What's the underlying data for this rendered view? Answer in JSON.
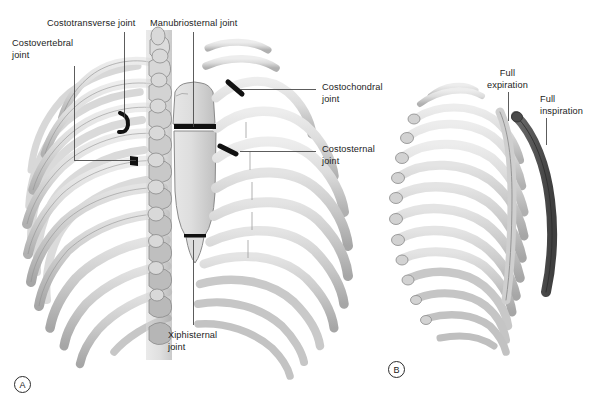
{
  "figure": {
    "background": "#ffffff",
    "type": "anatomical-illustration"
  },
  "palette": {
    "bone_light": "#e9e9e9",
    "bone_mid": "#d2d2d2",
    "bone_shade": "#b4b4b4",
    "bone_dark": "#9a9a9a",
    "outline": "#6e6e6e",
    "joint_marker": "#111111",
    "inspiration_rib": "#595959",
    "leader_line": "#4a4a4a",
    "text": "#1c1c1c"
  },
  "panels": [
    {
      "id": "A",
      "label": "A",
      "x": 14,
      "y": 376,
      "caption": "anterior view of thoracic cage with sternum and costal joints"
    },
    {
      "id": "B",
      "label": "B",
      "x": 388,
      "y": 361,
      "caption": "lateral view showing rib position in full expiration and full inspiration"
    }
  ],
  "annotations": [
    {
      "key": "costotransverse",
      "text": "Costotransverse joint",
      "lines": [
        "Costotransverse joint"
      ],
      "label_x": 47,
      "label_y": 18,
      "align": "left",
      "leader": [
        [
          124,
          32
        ],
        [
          124,
          118
        ]
      ],
      "marker": {
        "x": 124,
        "y": 120,
        "kind": "curved-black-band"
      }
    },
    {
      "key": "costovertebral",
      "text": "Costovertebral joint",
      "lines": [
        "Costovertebral",
        "joint"
      ],
      "label_x": 12,
      "label_y": 38,
      "align": "left",
      "leader": [
        [
          74,
          66
        ],
        [
          74,
          160
        ],
        [
          136,
          160
        ]
      ],
      "marker": {
        "x": 136,
        "y": 160,
        "kind": "short-black-band"
      }
    },
    {
      "key": "manubriosternal",
      "text": "Manubriosternal joint",
      "lines": [
        "Manubriosternal joint"
      ],
      "label_x": 150,
      "label_y": 18,
      "align": "left",
      "leader": [
        [
          193,
          32
        ],
        [
          193,
          127
        ]
      ],
      "marker": {
        "x": 193,
        "y": 127,
        "kind": "thick-black-line"
      }
    },
    {
      "key": "costochondral",
      "text": "Costochondral joint",
      "lines": [
        "Costochondral",
        "joint"
      ],
      "label_x": 322,
      "label_y": 82,
      "align": "left",
      "leader": [
        [
          316,
          89
        ],
        [
          240,
          89
        ]
      ],
      "marker": {
        "x": 238,
        "y": 90,
        "kind": "angled-black-band"
      }
    },
    {
      "key": "costosternal",
      "text": "Costosternal joint",
      "lines": [
        "Costosternal",
        "joint"
      ],
      "label_x": 322,
      "label_y": 144,
      "align": "left",
      "leader": [
        [
          316,
          151
        ],
        [
          240,
          151
        ]
      ],
      "marker": {
        "x": 238,
        "y": 151,
        "kind": "angled-black-band"
      }
    },
    {
      "key": "xiphisternal",
      "text": "Xiphisternal joint",
      "lines": [
        "Xiphisternal",
        "joint"
      ],
      "label_x": 168,
      "label_y": 330,
      "align": "left",
      "leader": [
        [
          193,
          240
        ],
        [
          193,
          325
        ]
      ],
      "marker": {
        "x": 193,
        "y": 238,
        "kind": "thin-black-line"
      }
    },
    {
      "key": "full-expiration",
      "text": "Full expiration",
      "lines": [
        "Full",
        "expiration"
      ],
      "label_x": 487,
      "label_y": 68,
      "align": "center",
      "leader": [
        [
          508,
          92
        ],
        [
          508,
          121
        ]
      ],
      "marker": null
    },
    {
      "key": "full-inspiration",
      "text": "Full inspiration",
      "lines": [
        "Full",
        "inspiration"
      ],
      "label_x": 540,
      "label_y": 94,
      "align": "left",
      "leader": [
        [
          546,
          118
        ],
        [
          546,
          145
        ]
      ],
      "marker": null
    }
  ],
  "structures": {
    "sternum": {
      "parts": [
        "manubrium",
        "body of sternum",
        "xiphoid process"
      ]
    },
    "vertebral_column": {
      "visible": true,
      "side": "left of panel A"
    },
    "ribs_panel_a": {
      "count": 10
    },
    "ribs_panel_b": {
      "count": 11,
      "highlighted_rib": "full inspiration position"
    }
  }
}
